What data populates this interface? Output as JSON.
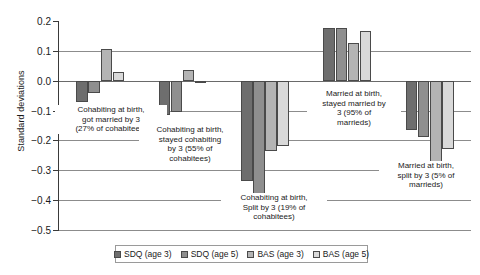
{
  "chart_data": {
    "type": "bar",
    "title": "",
    "xlabel": "",
    "ylabel": "Standard deviations",
    "ylim": [
      -0.5,
      0.2
    ],
    "yticks": [
      0.2,
      0.1,
      0.0,
      -0.1,
      -0.2,
      -0.3,
      -0.4,
      -0.5
    ],
    "ytick_labels": [
      "0.2",
      "0.1",
      "0.0",
      "−0.1",
      "−0.2",
      "−0.3",
      "−0.4",
      "−0.5"
    ],
    "grid": true,
    "legend_position": "bottom",
    "categories": [
      "Cohabiting at birth, got married by 3 (27% of cohabitees)",
      "Cohabiting at birth, stayed cohabiting by 3 (55% of cohabitees)",
      "Cohabiting at birth, Split by 3 (19% of cohabitees)",
      "Married at birth, stayed married by 3 (95% of marrieds)",
      "Married at birth, split by 3 (5% of marrieds)"
    ],
    "category_annotations": [
      [
        "Cohabiting at birth,",
        "got married by 3",
        "(27% of cohabitees)"
      ],
      [
        "Cohabiting at birth,",
        "stayed cohabiting",
        "by 3 (55% of",
        "cohabitees)"
      ],
      [
        "Cohabiting at birth,",
        "Split by 3 (19% of",
        "cohabitees)"
      ],
      [
        "Married at birth,",
        "stayed married by",
        "3 (95% of",
        "marrieds)"
      ],
      [
        "Married at birth,",
        "split by 3 (5% of",
        "marrieds)"
      ]
    ],
    "series": [
      {
        "name": "SDQ (age 3)",
        "color": "#6e6e6e",
        "values": [
          -0.07,
          -0.115,
          -0.335,
          0.175,
          -0.165
        ]
      },
      {
        "name": "SDQ (age 5)",
        "color": "#8f8f8f",
        "values": [
          -0.04,
          -0.105,
          -0.38,
          0.175,
          -0.19
        ]
      },
      {
        "name": "BAS (age 3)",
        "color": "#b4b4b4",
        "values": [
          0.105,
          0.035,
          -0.235,
          0.125,
          -0.31
        ]
      },
      {
        "name": "BAS (age 5)",
        "color": "#d9d9d9",
        "values": [
          0.028,
          -0.005,
          -0.22,
          0.165,
          -0.23
        ]
      }
    ]
  },
  "legend": {
    "items": [
      {
        "label": "SDQ (age 3)"
      },
      {
        "label": "SDQ (age 5)"
      },
      {
        "label": "BAS (age 3)"
      },
      {
        "label": "BAS (age 5)"
      }
    ]
  }
}
